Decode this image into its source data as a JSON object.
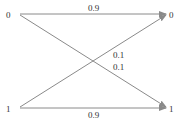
{
  "diagram": {
    "type": "binary-symmetric-channel",
    "input_nodes": [
      {
        "label": "0",
        "x": 5,
        "y": 17
      },
      {
        "label": "1",
        "x": 5,
        "y": 111
      }
    ],
    "output_nodes": [
      {
        "label": "0",
        "x": 169,
        "y": 17
      },
      {
        "label": "1",
        "x": 169,
        "y": 111
      }
    ],
    "edges": [
      {
        "from": "0",
        "to": "0",
        "probability": "0.9"
      },
      {
        "from": "0",
        "to": "1",
        "probability": "0.1"
      },
      {
        "from": "1",
        "to": "0",
        "probability": "0.1"
      },
      {
        "from": "1",
        "to": "1",
        "probability": "0.9"
      }
    ],
    "labels": {
      "top": "0.9",
      "cross_upper": "0.1",
      "cross_lower": "0.1",
      "bottom": "0.9"
    },
    "colors": {
      "line": "#8a8a8a",
      "text": "#333333"
    }
  }
}
